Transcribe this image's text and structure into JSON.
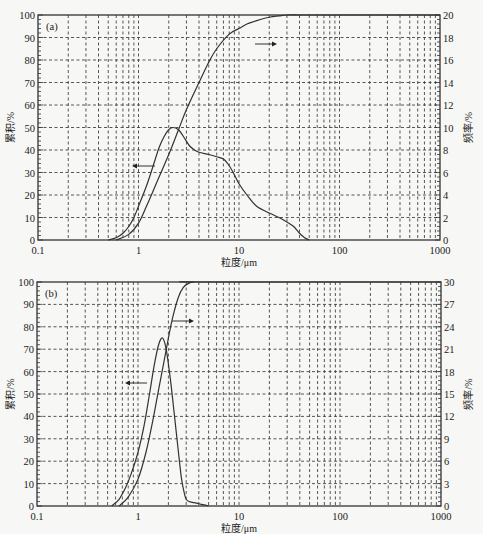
{
  "chart_data": [
    {
      "id": "a",
      "type": "line",
      "panel_label": "(a)",
      "xlabel": "粒度/μm",
      "ylabel": "累积/%",
      "y2label": "频率/%",
      "xscale": "log",
      "xlim": [
        0.1,
        1000
      ],
      "ylim": [
        0,
        100
      ],
      "y2lim": [
        0,
        20
      ],
      "xticks": [
        "0.1",
        "1",
        "10",
        "100",
        "1000"
      ],
      "yticks": [
        "0",
        "10",
        "20",
        "30",
        "40",
        "50",
        "60",
        "70",
        "80",
        "90",
        "100"
      ],
      "y2ticks": [
        "0",
        "2",
        "4",
        "6",
        "8",
        "10",
        "12",
        "14",
        "16",
        "18",
        "20"
      ],
      "grid": true,
      "series": [
        {
          "name": "频率",
          "axis": "left",
          "note": "arrow points left",
          "x": [
            0.5,
            0.6,
            0.7,
            0.8,
            0.9,
            1.0,
            1.2,
            1.4,
            1.6,
            1.8,
            2.0,
            2.2,
            2.5,
            2.8,
            3.2,
            3.6,
            4.0,
            5.0,
            6.0,
            7.0,
            8.0,
            9.0,
            10,
            12,
            15,
            20,
            25,
            30,
            35,
            40,
            45,
            50
          ],
          "values": [
            0,
            1,
            3,
            6,
            10,
            15,
            24,
            33,
            41,
            46,
            49,
            50,
            49,
            46,
            42,
            40,
            39,
            38,
            37,
            36,
            33,
            29,
            25,
            20,
            15,
            12,
            10,
            8,
            6,
            3,
            1,
            0
          ]
        },
        {
          "name": "累积",
          "axis": "right",
          "note": "arrow points right",
          "x": [
            0.6,
            0.8,
            1.0,
            1.2,
            1.5,
            2.0,
            2.5,
            3.0,
            4.0,
            5.0,
            6.0,
            8.0,
            10,
            12,
            15,
            20,
            25,
            30,
            40,
            50,
            60,
            1000
          ],
          "values": [
            0,
            0.5,
            1.5,
            3,
            5,
            7.6,
            9.8,
            11.6,
            14,
            15.8,
            17,
            18.3,
            19.4,
            19.8,
            19.95,
            20,
            20,
            20,
            20,
            20,
            20,
            20
          ],
          "values_cumulative_pct": [
            0,
            2.5,
            7.5,
            15,
            25,
            38,
            49,
            58,
            70,
            79,
            85,
            91.5,
            94,
            96,
            97.5,
            99,
            99.6,
            100,
            100,
            100,
            100,
            100
          ]
        }
      ]
    },
    {
      "id": "b",
      "type": "line",
      "panel_label": "(b)",
      "xlabel": "粒度/μm",
      "ylabel": "累积/%",
      "y2label": "频率/%",
      "xscale": "log",
      "xlim": [
        0.1,
        1000
      ],
      "ylim": [
        0,
        100
      ],
      "y2lim": [
        0,
        30
      ],
      "xticks": [
        "0.1",
        "1",
        "10",
        "100",
        "1000"
      ],
      "yticks": [
        "0",
        "10",
        "20",
        "30",
        "40",
        "50",
        "60",
        "70",
        "80",
        "90",
        "100"
      ],
      "y2ticks": [
        "0",
        "3",
        "6",
        "9",
        "12",
        "15",
        "18",
        "21",
        "24",
        "27",
        "30"
      ],
      "grid": true,
      "series": [
        {
          "name": "频率",
          "axis": "left",
          "note": "arrow points left",
          "x": [
            0.55,
            0.65,
            0.75,
            0.85,
            1.0,
            1.15,
            1.3,
            1.45,
            1.6,
            1.75,
            1.9,
            2.1,
            2.3,
            2.5,
            2.7,
            2.9,
            3.0,
            3.2,
            3.6,
            4.0,
            4.5,
            5.0
          ],
          "values": [
            0,
            3,
            8,
            14,
            24,
            36,
            50,
            63,
            72,
            75,
            70,
            56,
            40,
            25,
            12,
            5,
            3,
            2,
            1.5,
            1,
            0.5,
            0
          ],
          "values_pct_freq": [
            0,
            0.9,
            2.4,
            4.2,
            7.2,
            10.8,
            15,
            18.9,
            21.6,
            22.5,
            21,
            16.8,
            12,
            7.5,
            3.6,
            1.5,
            0.9,
            0.6,
            0.45,
            0.3,
            0.15,
            0
          ]
        },
        {
          "name": "累积",
          "axis": "right",
          "note": "arrow points right",
          "x": [
            0.65,
            0.8,
            1.0,
            1.2,
            1.4,
            1.6,
            1.8,
            2.0,
            2.2,
            2.5,
            2.8,
            3.2,
            3.6,
            4.0,
            1000
          ],
          "values": [
            0,
            4,
            12,
            24,
            38,
            52,
            64,
            75,
            84,
            93,
            97.5,
            99.5,
            100,
            100,
            100
          ]
        }
      ]
    }
  ],
  "labels": {
    "a_panel": "(a)",
    "b_panel": "(b)",
    "xlabel": "粒度/μm",
    "ylabel": "累积/%",
    "y2label": "频率/%"
  }
}
